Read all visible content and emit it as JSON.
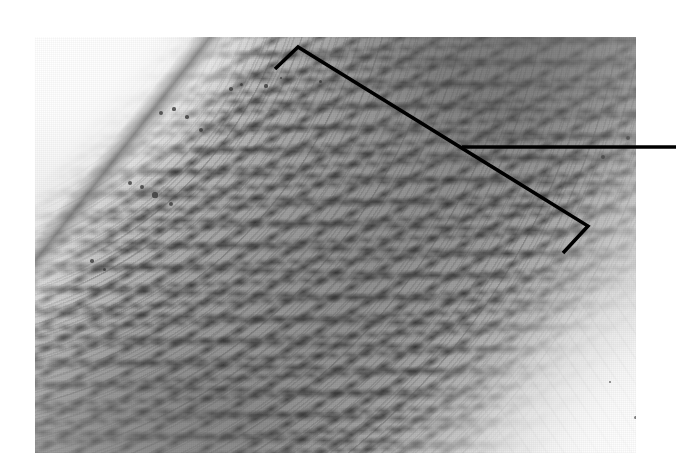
{
  "figure": {
    "kind": "light-micrograph",
    "background_color": "#ffffff",
    "caption": ""
  },
  "plate": {
    "name": "micrograph-plate",
    "left": 35,
    "top": 37,
    "width": 601,
    "height": 416,
    "tone": {
      "lightest": "#efeeec",
      "midtone": "#a9a59c",
      "darkest": "#4e4b46",
      "paper": "#ffffff"
    },
    "regions": [
      {
        "name": "lumen",
        "label": "",
        "position": "upper-left",
        "tone": "#efeeec"
      },
      {
        "name": "intima-border",
        "label": "",
        "position": "upper-left-diagonal",
        "tone": "#3e3c39"
      },
      {
        "name": "media-lamellae",
        "label": "",
        "position": "center-diagonal-band",
        "tone": "#94908e"
      },
      {
        "name": "media-dense",
        "label": "",
        "position": "top-right",
        "tone": "#4e4b46"
      },
      {
        "name": "adventitia",
        "label": "",
        "position": "lower-right",
        "tone": "#f2f0ec"
      }
    ]
  },
  "annotation": {
    "name": "media-bracket",
    "label": "",
    "stroke_color": "#000000",
    "stroke_width": 3.5,
    "bracket_top": {
      "tick_end_x": 275,
      "tick_end_y": 69,
      "apex_x": 298,
      "apex_y": 47
    },
    "bracket_diagonal": {
      "x1": 298,
      "y1": 47,
      "x2": 588,
      "y2": 226
    },
    "bracket_bottom": {
      "apex_x": 588,
      "apex_y": 226,
      "tick_end_x": 563,
      "tick_end_y": 253
    },
    "leader_line": {
      "x1": 462,
      "y1": 147,
      "x2": 676,
      "y2": 147
    }
  },
  "nuclei_dots": [
    {
      "x": 126,
      "y": 76,
      "r": 2.0
    },
    {
      "x": 139,
      "y": 72,
      "r": 1.6
    },
    {
      "x": 152,
      "y": 80,
      "r": 1.7
    },
    {
      "x": 166,
      "y": 93,
      "r": 2.2
    },
    {
      "x": 196,
      "y": 52,
      "r": 1.8
    },
    {
      "x": 206,
      "y": 47,
      "r": 1.5
    },
    {
      "x": 231,
      "y": 49,
      "r": 1.6
    },
    {
      "x": 95,
      "y": 146,
      "r": 2.4
    },
    {
      "x": 107,
      "y": 150,
      "r": 1.9
    },
    {
      "x": 120,
      "y": 158,
      "r": 2.6
    },
    {
      "x": 136,
      "y": 167,
      "r": 2.1
    },
    {
      "x": 57,
      "y": 224,
      "r": 1.7
    },
    {
      "x": 69,
      "y": 232,
      "r": 1.5
    },
    {
      "x": 246,
      "y": 41,
      "r": 1.4
    },
    {
      "x": 285,
      "y": 44,
      "r": 1.5
    },
    {
      "x": 568,
      "y": 120,
      "r": 2.3
    },
    {
      "x": 593,
      "y": 101,
      "r": 2.0
    },
    {
      "x": 610,
      "y": 290,
      "r": 1.8
    },
    {
      "x": 624,
      "y": 330,
      "r": 1.6
    },
    {
      "x": 600,
      "y": 380,
      "r": 1.5
    },
    {
      "x": 575,
      "y": 345,
      "r": 1.4
    },
    {
      "x": 630,
      "y": 420,
      "r": 1.7
    }
  ]
}
